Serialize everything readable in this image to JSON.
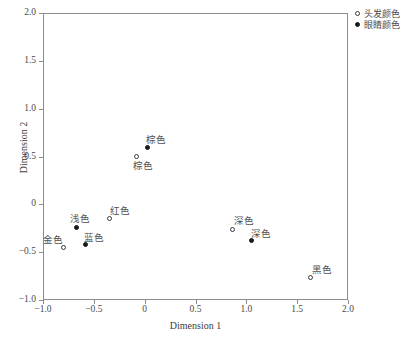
{
  "chart_data": {
    "type": "scatter",
    "title": "",
    "xlabel": "Dimension 1",
    "ylabel": "Dimension 2",
    "xlim": [
      -1.0,
      2.0
    ],
    "ylim": [
      -1.0,
      2.0
    ],
    "xticks": [
      "-1.0",
      "-0.5",
      "0",
      "0.5",
      "1.0",
      "1.5",
      "2.0"
    ],
    "xtick_values": [
      -1.0,
      -0.5,
      0,
      0.5,
      1.0,
      1.5,
      2.0
    ],
    "yticks": [
      "-1.0",
      "-0.5",
      "0",
      "0.5",
      "1.0",
      "1.5",
      "2.0"
    ],
    "ytick_values": [
      -1.0,
      -0.5,
      0,
      0.5,
      1.0,
      1.5,
      2.0
    ],
    "grid": false,
    "legend_position": "top-right",
    "series": [
      {
        "name": "头发颜色",
        "marker": "open-circle",
        "points": [
          {
            "label": "金色",
            "x": -0.8,
            "y": -0.45,
            "label_dx": -20,
            "label_dy": -11
          },
          {
            "label": "红色",
            "x": -0.35,
            "y": -0.15,
            "label_dx": 1,
            "label_dy": -12
          },
          {
            "label": "棕色",
            "x": -0.085,
            "y": 0.5,
            "label_dx": -3,
            "label_dy": 5
          },
          {
            "label": "深色",
            "x": 0.86,
            "y": -0.26,
            "label_dx": 2,
            "label_dy": -12
          },
          {
            "label": "黑色",
            "x": 1.63,
            "y": -0.77,
            "label_dx": 2,
            "label_dy": -12
          }
        ]
      },
      {
        "name": "眼睛颜色",
        "marker": "filled-circle",
        "points": [
          {
            "label": "浅色",
            "x": -0.67,
            "y": -0.24,
            "label_dx": -7,
            "label_dy": -12
          },
          {
            "label": "蓝色",
            "x": -0.58,
            "y": -0.42,
            "label_dx": -2,
            "label_dy": -11
          },
          {
            "label": "棕色",
            "x": 0.03,
            "y": 0.59,
            "label_dx": -2,
            "label_dy": -12
          },
          {
            "label": "深色",
            "x": 1.05,
            "y": -0.38,
            "label_dx": 0,
            "label_dy": -11
          }
        ]
      }
    ],
    "legend": [
      {
        "label": "头发颜色",
        "marker": "open-circle"
      },
      {
        "label": "眼睛颜色",
        "marker": "filled-circle"
      }
    ]
  }
}
